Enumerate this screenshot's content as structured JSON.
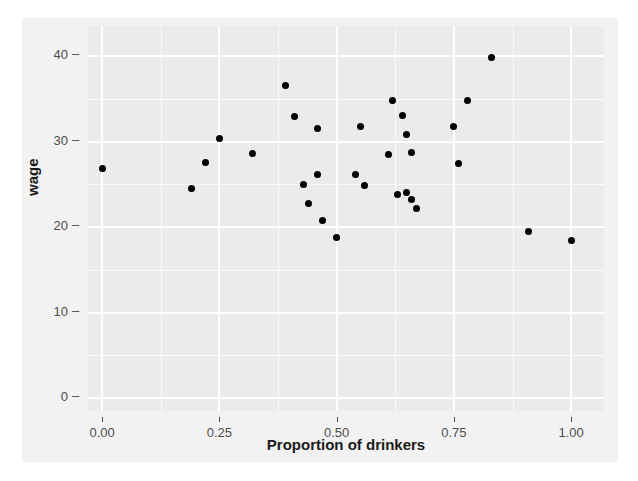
{
  "chart_data": {
    "type": "scatter",
    "title": "",
    "xlabel": "Proportion of drinkers",
    "ylabel": "wage",
    "xlim": [
      -0.03,
      1.07
    ],
    "ylim": [
      -1.5,
      43.5
    ],
    "grid": true,
    "legend": "none",
    "xticks": [
      "0.00",
      "0.25",
      "0.50",
      "0.75",
      "1.00"
    ],
    "xtick_values": [
      0.0,
      0.25,
      0.5,
      0.75,
      1.0
    ],
    "yticks": [
      "0",
      "10",
      "20",
      "30",
      "40"
    ],
    "ytick_values": [
      0,
      10,
      20,
      30,
      40
    ],
    "marker": "filled-circle",
    "marker_color": "#000000",
    "panel_background": "#ebebeb",
    "grid_color": "#ffffff",
    "figure_background": "#f2f2f2",
    "x": [
      0.0,
      0.19,
      0.22,
      0.25,
      0.32,
      0.39,
      0.41,
      0.43,
      0.44,
      0.46,
      0.46,
      0.47,
      0.5,
      0.54,
      0.55,
      0.56,
      0.61,
      0.62,
      0.63,
      0.64,
      0.65,
      0.65,
      0.66,
      0.66,
      0.67,
      0.75,
      0.76,
      0.78,
      0.83,
      0.91,
      1.0
    ],
    "y": [
      26.8,
      24.5,
      27.6,
      30.4,
      28.6,
      36.5,
      32.9,
      25.0,
      22.8,
      26.2,
      31.5,
      20.8,
      18.8,
      26.1,
      31.7,
      24.8,
      28.5,
      34.8,
      23.8,
      33.0,
      30.8,
      24.0,
      23.2,
      28.7,
      22.2,
      31.8,
      27.4,
      34.8,
      39.8,
      19.5,
      18.4
    ],
    "points": [
      {
        "x": 0.0,
        "y": 26.8
      },
      {
        "x": 0.19,
        "y": 24.5
      },
      {
        "x": 0.22,
        "y": 27.6
      },
      {
        "x": 0.25,
        "y": 30.4
      },
      {
        "x": 0.32,
        "y": 28.6
      },
      {
        "x": 0.39,
        "y": 36.5
      },
      {
        "x": 0.41,
        "y": 32.9
      },
      {
        "x": 0.43,
        "y": 25.0
      },
      {
        "x": 0.44,
        "y": 22.8
      },
      {
        "x": 0.46,
        "y": 26.2
      },
      {
        "x": 0.46,
        "y": 31.5
      },
      {
        "x": 0.47,
        "y": 20.8
      },
      {
        "x": 0.5,
        "y": 18.8
      },
      {
        "x": 0.54,
        "y": 26.1
      },
      {
        "x": 0.55,
        "y": 31.7
      },
      {
        "x": 0.56,
        "y": 24.8
      },
      {
        "x": 0.61,
        "y": 28.5
      },
      {
        "x": 0.62,
        "y": 34.8
      },
      {
        "x": 0.63,
        "y": 23.8
      },
      {
        "x": 0.64,
        "y": 33.0
      },
      {
        "x": 0.65,
        "y": 30.8
      },
      {
        "x": 0.65,
        "y": 24.0
      },
      {
        "x": 0.66,
        "y": 23.2
      },
      {
        "x": 0.66,
        "y": 28.7
      },
      {
        "x": 0.67,
        "y": 22.2
      },
      {
        "x": 0.75,
        "y": 31.8
      },
      {
        "x": 0.76,
        "y": 27.4
      },
      {
        "x": 0.78,
        "y": 34.8
      },
      {
        "x": 0.83,
        "y": 39.8
      },
      {
        "x": 0.91,
        "y": 19.5
      },
      {
        "x": 1.0,
        "y": 18.4
      }
    ]
  },
  "axes": {
    "y_title": "wage",
    "x_title": "Proportion of drinkers",
    "tick_dash": "–"
  }
}
